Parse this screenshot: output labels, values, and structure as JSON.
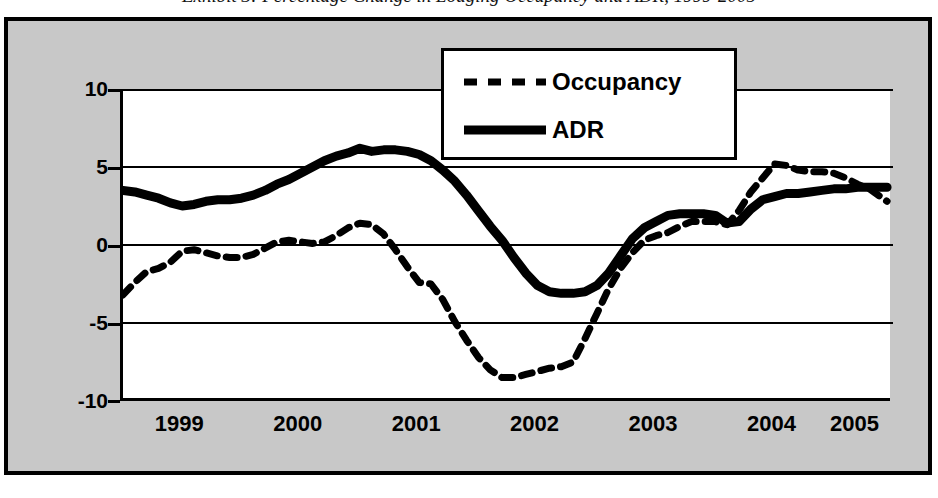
{
  "caption": {
    "text": "Exhibit 3: Percentage Change in Lodging Occupancy and ADR, 1999-2005"
  },
  "legend": {
    "position": "top-center-inside",
    "items": [
      {
        "label": "Occupancy",
        "style": "dashed",
        "color": "#000000"
      },
      {
        "label": "ADR",
        "style": "solid",
        "color": "#000000"
      }
    ]
  },
  "axes": {
    "y_ticks": [
      "10",
      "5",
      "0",
      "-5",
      "-10"
    ],
    "x_ticks": [
      "1999",
      "2000",
      "2001",
      "2002",
      "2003",
      "2004",
      "2005"
    ]
  },
  "chart_data": {
    "type": "line",
    "title": "Exhibit 3: Percentage Change in Lodging Occupancy and ADR, 1999-2005",
    "xlabel": "",
    "ylabel": "",
    "ylim": [
      -10,
      10
    ],
    "xlim": [
      1999.0,
      2005.5
    ],
    "grid": true,
    "gridlines_y": [
      10,
      5,
      0,
      -5,
      -10
    ],
    "legend_position": "top-center",
    "x_tick_labels": [
      "1999",
      "2000",
      "2001",
      "2002",
      "2003",
      "2004",
      "2005"
    ],
    "x_tick_values": [
      1999.5,
      2000.5,
      2001.5,
      2002.5,
      2003.5,
      2004.5,
      2005.2
    ],
    "y_tick_labels": [
      "10",
      "5",
      "0",
      "-5",
      "-10"
    ],
    "y_tick_values": [
      10,
      5,
      0,
      -5,
      -10
    ],
    "x": [
      1999.0,
      1999.1,
      1999.2,
      1999.3,
      1999.4,
      1999.5,
      1999.6,
      1999.7,
      1999.8,
      1999.9,
      2000.0,
      2000.1,
      2000.2,
      2000.3,
      2000.4,
      2000.5,
      2000.6,
      2000.7,
      2000.8,
      2000.9,
      2001.0,
      2001.1,
      2001.2,
      2001.3,
      2001.4,
      2001.5,
      2001.6,
      2001.7,
      2001.8,
      2001.9,
      2002.0,
      2002.1,
      2002.2,
      2002.3,
      2002.4,
      2002.5,
      2002.6,
      2002.7,
      2002.8,
      2002.9,
      2003.0,
      2003.1,
      2003.2,
      2003.3,
      2003.4,
      2003.5,
      2003.6,
      2003.7,
      2003.8,
      2003.9,
      2004.0,
      2004.1,
      2004.2,
      2004.3,
      2004.4,
      2004.5,
      2004.6,
      2004.7,
      2004.8,
      2004.9,
      2005.0,
      2005.1,
      2005.2,
      2005.3,
      2005.45
    ],
    "series": [
      {
        "name": "Occupancy",
        "style": "dashed",
        "color": "#000000",
        "values": [
          -3.2,
          -2.4,
          -1.7,
          -1.5,
          -1.1,
          -0.4,
          -0.3,
          -0.5,
          -0.7,
          -0.8,
          -0.8,
          -0.6,
          -0.2,
          0.2,
          0.3,
          0.2,
          0.1,
          0.2,
          0.6,
          1.1,
          1.4,
          1.3,
          0.7,
          -0.3,
          -1.4,
          -2.4,
          -2.5,
          -3.5,
          -4.9,
          -6.1,
          -7.2,
          -8.0,
          -8.5,
          -8.5,
          -8.3,
          -8.1,
          -7.9,
          -7.8,
          -7.5,
          -6.0,
          -4.4,
          -2.8,
          -1.5,
          -0.5,
          0.3,
          0.6,
          0.8,
          1.2,
          1.5,
          1.5,
          1.5,
          1.3,
          2.2,
          3.4,
          4.3,
          5.2,
          5.1,
          4.8,
          4.7,
          4.7,
          4.6,
          4.3,
          3.9,
          3.6,
          2.8
        ]
      },
      {
        "name": "ADR",
        "style": "solid",
        "color": "#000000",
        "values": [
          3.5,
          3.4,
          3.2,
          3.0,
          2.7,
          2.5,
          2.6,
          2.8,
          2.9,
          2.9,
          3.0,
          3.2,
          3.5,
          3.9,
          4.2,
          4.6,
          5.0,
          5.4,
          5.7,
          5.9,
          6.2,
          6.0,
          6.1,
          6.1,
          6.0,
          5.8,
          5.4,
          4.8,
          4.1,
          3.2,
          2.2,
          1.2,
          0.3,
          -0.8,
          -1.8,
          -2.6,
          -3.0,
          -3.1,
          -3.1,
          -3.0,
          -2.6,
          -1.8,
          -0.7,
          0.4,
          1.1,
          1.5,
          1.9,
          2.0,
          2.0,
          2.0,
          1.9,
          1.4,
          1.5,
          2.3,
          2.9,
          3.1,
          3.3,
          3.3,
          3.4,
          3.5,
          3.6,
          3.6,
          3.7,
          3.7,
          3.7
        ]
      }
    ]
  }
}
